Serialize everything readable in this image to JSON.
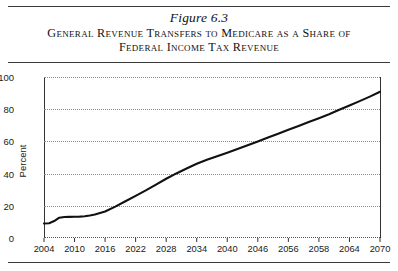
{
  "figure": {
    "number_label": "Figure 6.3",
    "title_line1": "General Revenue Transfers to Medicare as a Share of",
    "title_line2": "Federal Income Tax Revenue"
  },
  "chart_data": {
    "type": "line",
    "title": "General Revenue Transfers to Medicare as a Share of Federal Income Tax Revenue",
    "xlabel": "",
    "ylabel": "Percent",
    "ylim": [
      0,
      100
    ],
    "xlim": [
      2004,
      2070
    ],
    "grid": true,
    "legend": "none",
    "yticks": [
      "0",
      "20",
      "40",
      "60",
      "80",
      "100"
    ],
    "ytick_values": [
      0,
      20,
      40,
      60,
      80,
      100
    ],
    "xticks": [
      "2004",
      "2010",
      "2016",
      "2022",
      "2028",
      "2034",
      "2040",
      "2046",
      "2056",
      "2058",
      "2064",
      "2070"
    ],
    "xtick_values": [
      2004,
      2010,
      2016,
      2022,
      2028,
      2034,
      2040,
      2046,
      2052,
      2058,
      2064,
      2070
    ],
    "line_color": "#111111",
    "series": [
      {
        "name": "General revenue transfers to Medicare as share of federal income tax revenue",
        "x": [
          2004,
          2005,
          2006,
          2007,
          2008,
          2009,
          2010,
          2011,
          2012,
          2013,
          2014,
          2016,
          2018,
          2020,
          2022,
          2024,
          2026,
          2028,
          2030,
          2032,
          2034,
          2036,
          2038,
          2040,
          2042,
          2044,
          2046,
          2048,
          2050,
          2052,
          2054,
          2056,
          2058,
          2060,
          2062,
          2064,
          2066,
          2068,
          2070
        ],
        "values": [
          9,
          9.2,
          10.5,
          12.6,
          13,
          13.1,
          13.2,
          13.3,
          13.5,
          14,
          14.6,
          16.5,
          19.5,
          22.8,
          26.2,
          29.6,
          33.2,
          36.8,
          40.1,
          43.2,
          46.1,
          48.6,
          50.8,
          53,
          55.3,
          57.6,
          60,
          62.4,
          64.8,
          67.2,
          69.6,
          72,
          74.4,
          76.9,
          79.6,
          82.3,
          85,
          87.8,
          90.8
        ]
      }
    ]
  }
}
